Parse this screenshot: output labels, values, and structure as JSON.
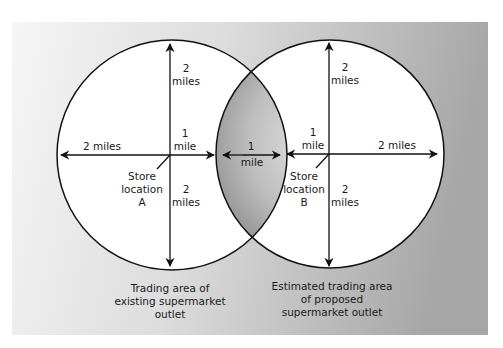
{
  "diagram": {
    "colors": {
      "panel_left": "#f4f4f4",
      "panel_right": "#a9a9a9",
      "circle_fill": "#ffffff",
      "overlap_center": "#e6e6e6",
      "overlap_edge": "#8f8f8f",
      "stroke": "#111111"
    },
    "store_a": {
      "up_value": "2",
      "up_unit": "miles",
      "left_label": "2 miles",
      "right_value": "1",
      "right_unit": "mile",
      "down_value": "2",
      "down_unit": "miles",
      "store_line1": "Store",
      "store_line2": "location",
      "store_line3": "A"
    },
    "store_b": {
      "up_value": "2",
      "up_unit": "miles",
      "right_label": "2 miles",
      "left_value": "1",
      "left_unit": "mile",
      "down_value": "2",
      "down_unit": "miles",
      "store_line1": "Store",
      "store_line2": "location",
      "store_line3": "B"
    },
    "overlap": {
      "value": "1",
      "unit": "mile"
    },
    "caption_a": {
      "line1": "Trading area of",
      "line2": "existing supermarket",
      "line3": "outlet"
    },
    "caption_b": {
      "line1": "Estimated trading area",
      "line2": "of proposed",
      "line3": "supermarket outlet"
    }
  }
}
